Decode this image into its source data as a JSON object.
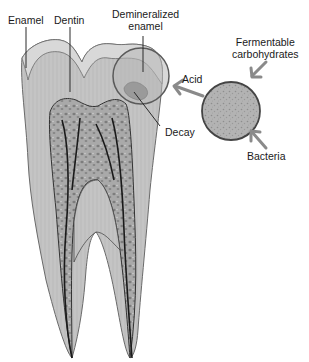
{
  "labels": {
    "enamel": "Enamel",
    "dentin": "Dentin",
    "demineralized_line1": "Demineralized",
    "demineralized_line2": "enamel",
    "fermentable_line1": "Fermentable",
    "fermentable_line2": "carbohydrates",
    "acid": "Acid",
    "decay": "Decay",
    "bacteria": "Bacteria"
  },
  "colors": {
    "enamel": "#c9c9c9",
    "dentin": "#bdbdbd",
    "pulp": "#9a9a9a",
    "outline": "#555555",
    "arrow": "#8a8a8a",
    "text": "#1a1a1a"
  }
}
